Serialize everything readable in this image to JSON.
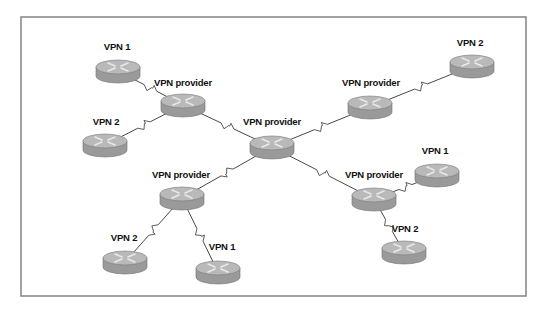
{
  "diagram": {
    "type": "network-topology",
    "frame": {
      "x": 21,
      "y": 17,
      "width": 505,
      "height": 279
    },
    "colors": {
      "router_top": "#b9b9b9",
      "router_side": "#9a9a9a",
      "router_arrows": "#e8e8e8",
      "link": "#333333",
      "frame": "#8a8a8a"
    },
    "nodes": [
      {
        "id": "vpn1_tl",
        "label": "VPN 1",
        "cx": 118,
        "cy": 67,
        "lx": 117,
        "ly": 47
      },
      {
        "id": "prov_tl",
        "label": "VPN provider",
        "cx": 183,
        "cy": 101,
        "lx": 183,
        "ly": 83
      },
      {
        "id": "vpn2_l",
        "label": "VPN 2",
        "cx": 105,
        "cy": 141,
        "lx": 106,
        "ly": 122
      },
      {
        "id": "prov_c",
        "label": "VPN provider",
        "cx": 272,
        "cy": 143,
        "lx": 272,
        "ly": 122
      },
      {
        "id": "prov_tr",
        "label": "VPN provider",
        "cx": 370,
        "cy": 103,
        "lx": 371,
        "ly": 83
      },
      {
        "id": "vpn2_tr",
        "label": "VPN 2",
        "cx": 472,
        "cy": 62,
        "lx": 470,
        "ly": 43
      },
      {
        "id": "prov_bl",
        "label": "VPN provider",
        "cx": 182,
        "cy": 194,
        "lx": 181,
        "ly": 175
      },
      {
        "id": "vpn2_bl",
        "label": "VPN 2",
        "cx": 125,
        "cy": 258,
        "lx": 124,
        "ly": 238
      },
      {
        "id": "vpn1_bm",
        "label": "VPN 1",
        "cx": 218,
        "cy": 268,
        "lx": 222,
        "ly": 247
      },
      {
        "id": "prov_br",
        "label": "VPN provider",
        "cx": 374,
        "cy": 195,
        "lx": 374,
        "ly": 175
      },
      {
        "id": "vpn1_r",
        "label": "VPN 1",
        "cx": 437,
        "cy": 171,
        "lx": 435,
        "ly": 151
      },
      {
        "id": "vpn2_br",
        "label": "VPN 2",
        "cx": 404,
        "cy": 248,
        "lx": 405,
        "ly": 229
      }
    ],
    "links": [
      {
        "from": "vpn1_tl",
        "to": "prov_tl"
      },
      {
        "from": "vpn2_l",
        "to": "prov_tl"
      },
      {
        "from": "prov_tl",
        "to": "prov_c"
      },
      {
        "from": "prov_c",
        "to": "prov_tr"
      },
      {
        "from": "prov_tr",
        "to": "vpn2_tr"
      },
      {
        "from": "prov_c",
        "to": "prov_bl"
      },
      {
        "from": "prov_bl",
        "to": "vpn2_bl"
      },
      {
        "from": "prov_bl",
        "to": "vpn1_bm"
      },
      {
        "from": "prov_c",
        "to": "prov_br"
      },
      {
        "from": "prov_br",
        "to": "vpn1_r"
      },
      {
        "from": "prov_br",
        "to": "vpn2_br"
      }
    ],
    "link_style": "serial-wan-lightning",
    "node_icon": "router-icon"
  }
}
